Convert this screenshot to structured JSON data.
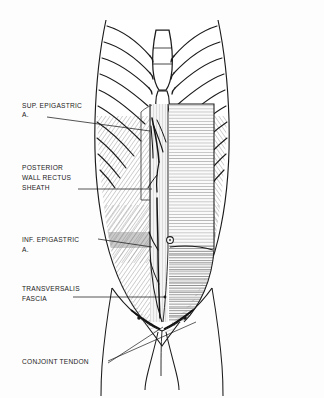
{
  "figure": {
    "style": "black-and-white line drawing with hatched shading",
    "background_color": "#ffffff",
    "ink_color": "#1b1b1b"
  },
  "labels": [
    {
      "id": "sup-epigastric",
      "lines": [
        "SUP. EPIGASTRIC",
        "A."
      ],
      "text_x": 22,
      "text_y": 108,
      "leader": "M 47 117 L 150 131",
      "target": "superior epigastric artery"
    },
    {
      "id": "posterior-wall-rectus-sheath",
      "lines": [
        "POSTERIOR",
        "WALL RECTUS",
        "SHEATH"
      ],
      "text_x": 22,
      "text_y": 170,
      "leader": "M 78 189 L 152 189",
      "target": "posterior wall of rectus sheath"
    },
    {
      "id": "inf-epigastric",
      "lines": [
        "INF. EPIGASTRIC",
        "A."
      ],
      "text_x": 22,
      "text_y": 242,
      "leader": "M 98 239 L 152 247",
      "target": "inferior epigastric artery"
    },
    {
      "id": "transversalis-fascia",
      "lines": [
        "TRANSVERSALIS",
        "FASCIA"
      ],
      "text_x": 22,
      "text_y": 291,
      "leader": "M 73 297 L 165 297",
      "target": "transversalis fascia"
    },
    {
      "id": "conjoint-tendon",
      "lines": [
        "CONJOINT TENDON"
      ],
      "text_x": 22,
      "text_y": 364,
      "leader_a": "M 108 361 L 196 322",
      "leader_b": "M 108 363 L 163 327",
      "target": "conjoint tendon"
    }
  ],
  "anatomy": {
    "structures": [
      "costal margin",
      "ribs",
      "costal cartilages",
      "xiphoid process",
      "sternum body",
      "posterior wall of rectus sheath",
      "arcuate line",
      "superior epigastric artery",
      "inferior epigastric artery",
      "umbilicus",
      "transversalis fascia",
      "conjoint tendon",
      "inguinal ligament",
      "pubic symphysis",
      "linea alba"
    ]
  },
  "colors": {
    "ink": "#1b1b1b",
    "mid_hatch": "#6a6a6a",
    "light_hatch": "#9a9a9a",
    "pale_fill": "#f2f2f2",
    "deep_shadow": "#111111",
    "paper": "#ffffff"
  }
}
